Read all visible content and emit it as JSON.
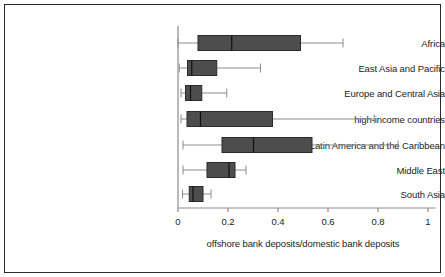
{
  "chart_data": {
    "type": "boxplot",
    "orientation": "horizontal",
    "title": "",
    "xlabel": "offshore bank deposits/domestic bank deposits",
    "ylabel": "",
    "xlim": [
      0,
      1.03
    ],
    "xticks": [
      0,
      0.2,
      0.4,
      0.6,
      0.8,
      1
    ],
    "xticklabels": [
      "0",
      "0.2",
      "0.4",
      "0.6",
      "0.8",
      "1"
    ],
    "grid": false,
    "legend": "none",
    "categories": [
      "Africa",
      "East Asia and Pacific",
      "Europe and Central Asia",
      "high-income countries",
      "Latin America and the Caribbean",
      "Middle East",
      "South Asia"
    ],
    "boxes": [
      {
        "category": "Africa",
        "whisker_low": 0.0,
        "q1": 0.08,
        "median": 0.215,
        "q3": 0.49,
        "whisker_high": 0.66
      },
      {
        "category": "East Asia and Pacific",
        "whisker_low": 0.005,
        "q1": 0.038,
        "median": 0.055,
        "q3": 0.155,
        "whisker_high": 0.33
      },
      {
        "category": "Europe and Central Asia",
        "whisker_low": 0.012,
        "q1": 0.03,
        "median": 0.05,
        "q3": 0.095,
        "whisker_high": 0.195
      },
      {
        "category": "high-income countries",
        "whisker_low": 0.012,
        "q1": 0.036,
        "median": 0.09,
        "q3": 0.378,
        "whisker_high": 0.785
      },
      {
        "category": "Latin America and the Caribbean",
        "whisker_low": 0.02,
        "q1": 0.176,
        "median": 0.302,
        "q3": 0.536,
        "whisker_high": 0.88
      },
      {
        "category": "Middle East",
        "whisker_low": 0.02,
        "q1": 0.116,
        "median": 0.204,
        "q3": 0.228,
        "whisker_high": 0.272
      },
      {
        "category": "South Asia",
        "whisker_low": 0.018,
        "q1": 0.045,
        "median": 0.06,
        "q3": 0.1,
        "whisker_high": 0.132
      }
    ],
    "colors": {
      "box_fill": "#4d4d4d",
      "box_edge": "#2b2b2b",
      "median_line": "#111111",
      "whisker": "#8c8c8c",
      "axis": "#8c8c8c",
      "frame": "#2b2b2b",
      "background": "#ffffff",
      "text": "#1c1c1c"
    }
  }
}
